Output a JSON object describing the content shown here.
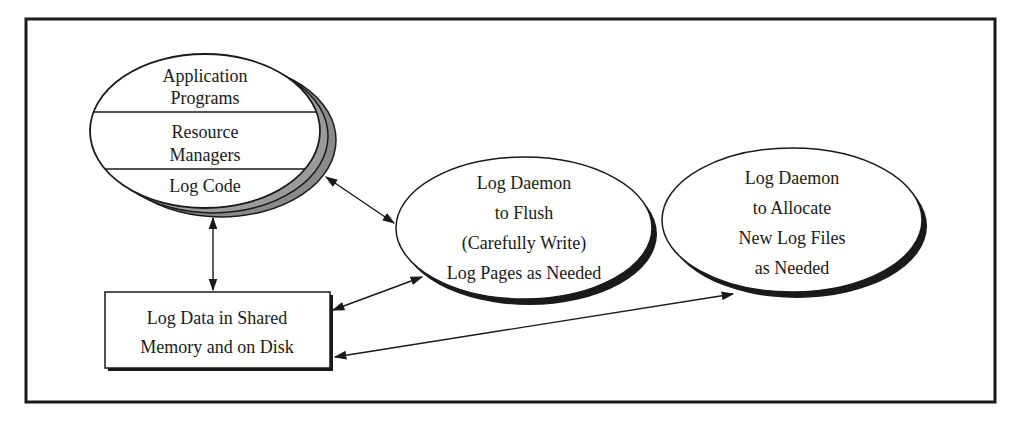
{
  "diagram": {
    "type": "process-architecture",
    "colors": {
      "line": "#1a1a1a",
      "shadow_gray": "#8a8a8a",
      "shadow_dark": "#1a1a1a",
      "background": "#ffffff"
    },
    "nodes": {
      "app_stack": {
        "layers": [
          {
            "lines": [
              "Application",
              "Programs"
            ]
          },
          {
            "lines": [
              "Resource",
              "Managers"
            ]
          },
          {
            "lines": [
              "Log Code"
            ]
          }
        ]
      },
      "flush_daemon": {
        "lines": [
          "Log Daemon",
          "to Flush",
          "(Carefully Write)",
          "Log Pages as Needed"
        ]
      },
      "allocate_daemon": {
        "lines": [
          "Log Daemon",
          "to Allocate",
          "New Log Files",
          "as Needed"
        ]
      },
      "log_data": {
        "lines": [
          "Log Data in Shared",
          "Memory and on Disk"
        ]
      }
    },
    "edges": [
      {
        "from": "app_stack",
        "to": "log_data",
        "direction": "both"
      },
      {
        "from": "app_stack",
        "to": "flush_daemon",
        "direction": "both"
      },
      {
        "from": "log_data",
        "to": "flush_daemon",
        "direction": "both"
      },
      {
        "from": "log_data",
        "to": "allocate_daemon",
        "direction": "both"
      }
    ]
  }
}
